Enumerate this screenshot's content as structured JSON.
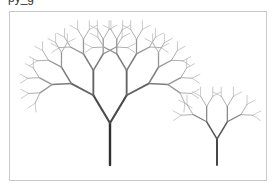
{
  "caption": {
    "text": "py_g"
  },
  "canvas": {
    "border_color": "#c8c8c8",
    "background": "#ffffff"
  },
  "trees": [
    {
      "name": "large-fractal-tree",
      "base": [
        110,
        165
      ],
      "trunk_length": 42,
      "angle_deg": 31,
      "length_ratio": 0.77,
      "depth": 7,
      "trunk_width": 2.4,
      "trunk_color": "#303030",
      "tip_color": "#b4b4b4"
    },
    {
      "name": "small-fractal-tree",
      "base": [
        217,
        165
      ],
      "trunk_length": 26,
      "angle_deg": 31,
      "length_ratio": 0.77,
      "depth": 5,
      "trunk_width": 1.8,
      "trunk_color": "#333333",
      "tip_color": "#b4b4b4"
    }
  ]
}
